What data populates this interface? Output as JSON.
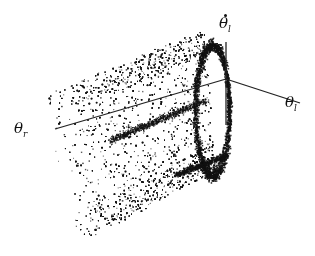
{
  "chart_data": {
    "type": "scatter",
    "subtype": "3d-point-cloud",
    "title": "",
    "axes": [
      {
        "name": "theta_l_dot",
        "label": "θ̇",
        "subscript": "l",
        "direction": "vertical"
      },
      {
        "name": "theta_l",
        "label": "θ",
        "subscript": "l",
        "direction": "right-down"
      },
      {
        "name": "theta_r",
        "label": "θ",
        "subscript": "r",
        "direction": "left-down"
      }
    ],
    "grid": false,
    "legend": null,
    "tick_labels": [],
    "origin_px": [
      226,
      79
    ],
    "axis_lines_px": {
      "theta_l_dot": [
        [
          226,
          42
        ],
        [
          226,
          125
        ]
      ],
      "theta_l": [
        [
          226,
          79
        ],
        [
          300,
          103
        ]
      ],
      "theta_r": [
        [
          226,
          79
        ],
        [
          55,
          129
        ]
      ]
    },
    "cloud": {
      "point_count": 5200,
      "ring_point_count": 2200,
      "band_start_x": 40,
      "band_end_x": 220,
      "color": "#111111"
    }
  },
  "labels": {
    "theta_l_dot": {
      "base": "θ",
      "sub": "l"
    },
    "theta_l": {
      "base": "θ",
      "sub": "l"
    },
    "theta_r": {
      "base": "θ",
      "sub": "r"
    }
  }
}
